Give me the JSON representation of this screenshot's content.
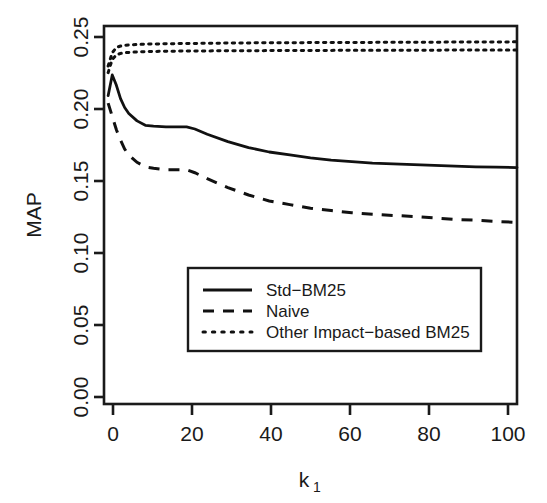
{
  "chart_data": {
    "type": "line",
    "title": "",
    "xlabel": "k_1",
    "xlabel_base": "k",
    "xlabel_sub": "1",
    "ylabel": "MAP",
    "xlim": [
      0,
      100
    ],
    "ylim": [
      0.0,
      0.255
    ],
    "grid": false,
    "legend_position": "bottom-center",
    "xticks": [
      0,
      20,
      40,
      60,
      80,
      100
    ],
    "xtick_labels": [
      "0",
      "20",
      "40",
      "60",
      "80",
      "100"
    ],
    "yticks": [
      0.0,
      0.05,
      0.1,
      0.15,
      0.2,
      0.25
    ],
    "ytick_labels": [
      "0.00",
      "0.05",
      "0.10",
      "0.15",
      "0.20",
      "0.25"
    ],
    "legend_entries": [
      {
        "label": "Std−BM25",
        "style": "solid"
      },
      {
        "label": "Naive",
        "style": "dashed"
      },
      {
        "label": "Other Impact−based BM25",
        "style": "dotted"
      }
    ],
    "series": [
      {
        "name": "Std−BM25",
        "style": "solid",
        "x": [
          1,
          2,
          3,
          4,
          5,
          6,
          8,
          10,
          12,
          15,
          18,
          20,
          22,
          25,
          30,
          35,
          40,
          45,
          50,
          55,
          60,
          65,
          70,
          75,
          80,
          85,
          90,
          95,
          100
        ],
        "values": [
          0.208,
          0.222,
          0.215,
          0.206,
          0.2,
          0.196,
          0.191,
          0.188,
          0.1875,
          0.187,
          0.187,
          0.187,
          0.1855,
          0.182,
          0.177,
          0.173,
          0.17,
          0.168,
          0.166,
          0.1645,
          0.1635,
          0.1625,
          0.162,
          0.1615,
          0.161,
          0.1605,
          0.16,
          0.1598,
          0.1595
        ]
      },
      {
        "name": "Naive",
        "style": "dashed",
        "x": [
          1,
          2,
          3,
          4,
          5,
          6,
          8,
          10,
          12,
          15,
          18,
          20,
          22,
          25,
          30,
          35,
          40,
          45,
          50,
          55,
          60,
          65,
          70,
          75,
          80,
          85,
          90,
          95,
          100
        ],
        "values": [
          0.203,
          0.194,
          0.185,
          0.178,
          0.172,
          0.168,
          0.163,
          0.16,
          0.159,
          0.158,
          0.158,
          0.158,
          0.156,
          0.152,
          0.146,
          0.141,
          0.137,
          0.1345,
          0.132,
          0.1305,
          0.129,
          0.128,
          0.1272,
          0.1265,
          0.1255,
          0.1245,
          0.124,
          0.1232,
          0.1225
        ]
      },
      {
        "name": "Other Impact−based BM25 (upper)",
        "style": "dotted",
        "x": [
          1,
          2,
          3,
          4,
          5,
          6,
          8,
          10,
          15,
          20,
          30,
          40,
          50,
          60,
          70,
          80,
          90,
          100
        ],
        "values": [
          0.228,
          0.237,
          0.2405,
          0.2415,
          0.242,
          0.2422,
          0.2425,
          0.2428,
          0.243,
          0.2432,
          0.2435,
          0.2437,
          0.2438,
          0.2439,
          0.244,
          0.2441,
          0.2442,
          0.2443
        ]
      },
      {
        "name": "Other Impact−based BM25 (lower)",
        "style": "dotted",
        "x": [
          1,
          2,
          3,
          4,
          5,
          6,
          8,
          10,
          15,
          20,
          30,
          40,
          50,
          60,
          70,
          80,
          90,
          100
        ],
        "values": [
          0.2235,
          0.2325,
          0.2355,
          0.2365,
          0.237,
          0.2372,
          0.2375,
          0.2377,
          0.238,
          0.2381,
          0.2383,
          0.2384,
          0.2385,
          0.2386,
          0.2386,
          0.2387,
          0.2388,
          0.2388
        ]
      }
    ]
  },
  "colors": {
    "foreground": "#1a1a1a",
    "background": "#ffffff",
    "series_ink": "#111111"
  }
}
